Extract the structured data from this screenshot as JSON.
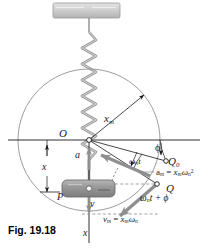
{
  "figure": {
    "caption": "Fig. 19.18"
  },
  "labels": {
    "origin": "O",
    "amplitude_radius": "x",
    "amplitude_radius_sub": "m",
    "phase_angle": "ϕ",
    "initial_point": "Q",
    "initial_point_sub": "0",
    "angle_wnt": "ω",
    "angle_wnt_sub": "n",
    "angle_wnt_tail": "t",
    "accel_label": "a",
    "accel_sub": "m",
    "accel_eq": "=",
    "accel_rhs": "x",
    "accel_rhs_sub": "m",
    "accel_omega": "ω",
    "accel_omega_sub": "n",
    "accel_omega_sup": "2",
    "rotating_point": "Q",
    "total_phase": "ω",
    "total_phase_sub": "n",
    "total_phase_tail": "t + ϕ",
    "vel_label": "v",
    "vel_sub": "m",
    "vel_eq": "=",
    "vel_rhs": "x",
    "vel_rhs_sub": "m",
    "vel_omega": "ω",
    "vel_omega_sub": "n",
    "accel_vector": "a",
    "displacement": "x",
    "block": "P",
    "velocity_vector": "v",
    "axis": "x"
  },
  "colors": {
    "line": "#1a1a1a",
    "circle": "#8a8a8a",
    "spring": "#9b9b9b",
    "block_fill": "#9e9e9e",
    "block_edge": "#6e6e6e",
    "support_fill": "#c9c9c9",
    "support_edge": "#9a9a9a",
    "vector_gray": "#8f8f8f",
    "dashed": "#8a8a8a"
  },
  "geometry": {
    "origin_x": 89,
    "origin_y": 140,
    "circle_radius": 71,
    "phi_degrees": 18,
    "omega_n_t_degrees": 35,
    "total_phase_degrees": 53
  },
  "icons": {
    "ceiling_support": "hatched-support-bar",
    "spring": "coil-spring",
    "block": "mass-block",
    "circle": "reference-circle",
    "arrow": "vector-arrow"
  }
}
